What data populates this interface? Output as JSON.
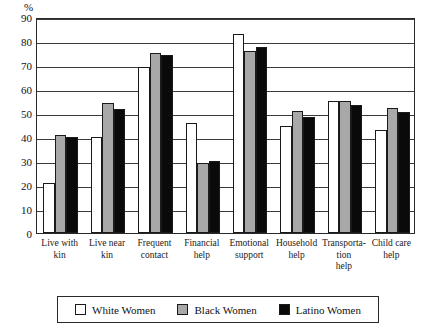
{
  "chart_data": {
    "type": "bar",
    "title": "",
    "xlabel": "",
    "ylabel": "%",
    "ylim": [
      0,
      90
    ],
    "yticks": [
      0,
      10,
      20,
      30,
      40,
      50,
      60,
      70,
      80,
      90
    ],
    "grid": true,
    "legend_position": "bottom",
    "categories": [
      "Live with kin",
      "Live near kin",
      "Frequent contact",
      "Financial help",
      "Emotional support",
      "Household help",
      "Transporta-tion help",
      "Child care help"
    ],
    "series": [
      {
        "name": "White Women",
        "color": "#ffffff",
        "values": [
          21,
          40,
          69,
          46,
          83,
          44.5,
          55,
          43
        ]
      },
      {
        "name": "Black Women",
        "color": "#a8a8a8",
        "values": [
          41,
          54,
          75,
          29,
          76,
          51,
          55,
          52
        ]
      },
      {
        "name": "Latino Women",
        "color": "#0a0a0a",
        "values": [
          40,
          51.5,
          74,
          30,
          77.5,
          48.5,
          53.5,
          50.5
        ]
      }
    ]
  }
}
